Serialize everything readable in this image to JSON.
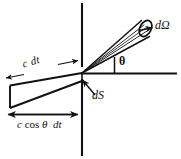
{
  "figure": {
    "name": "radiation-geometry-diagram",
    "background_color": "#ffffff",
    "ink_color": "#111111",
    "width": 181,
    "height": 159
  },
  "labels": {
    "solid_angle": "dΩ",
    "surface_element": "dS",
    "angle": "θ",
    "slab_length": "c dt",
    "projection_prefix": "c",
    "projection_cos": "cos",
    "projection_angle": "θ",
    "projection_suffix": "dt",
    "projection_full": "c cos θ dt"
  },
  "geometry": {
    "wall_line": {
      "x": 82,
      "y_top": 4,
      "y_bottom": 155,
      "gap_top": 66,
      "gap_bottom": 80
    },
    "apex": {
      "x": 82,
      "y": 73
    },
    "horizontal_axis": {
      "x_start": 82,
      "x_end": 176,
      "y": 73
    },
    "theta_tick": {
      "x": 114,
      "y_top": 57,
      "y_bottom": 73
    },
    "cone": {
      "axis_angle_deg": 28,
      "end_ellipse": {
        "cx": 145,
        "cy": 28,
        "rx": 5.5,
        "ry": 8.5,
        "rotation_deg": 28
      }
    },
    "slab": {
      "top_edge": {
        "x1": 10,
        "y1": 85,
        "x2": 82,
        "y2": 73
      },
      "bottom_edge": {
        "x1": 10,
        "y1": 108,
        "x2": 82,
        "y2": 81
      },
      "left_edge": {
        "x1": 10,
        "y1": 85,
        "x2": 10,
        "y2": 108
      }
    },
    "measure_arrow_bottom": {
      "x1": 8,
      "x2": 77,
      "y": 114
    },
    "measure_arrow_slab": {
      "x1": 6,
      "y1": 76,
      "x2": 78,
      "y2": 62
    }
  }
}
